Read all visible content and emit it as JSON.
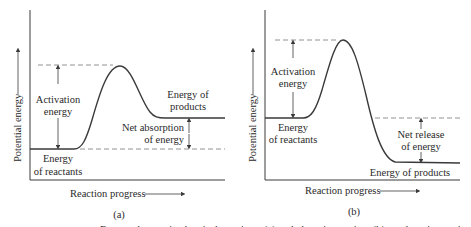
{
  "panels": [
    {
      "id": "a",
      "caption": "(a)",
      "ylabel": "Potential energy",
      "xlabel": "Reaction progress",
      "labels": {
        "activation_1": "Activation",
        "activation_2": "energy",
        "products_1": "Energy of",
        "products_2": "products",
        "net_1": "Net absorption",
        "net_2": "of energy",
        "reactants_1": "Energy",
        "reactants_2": "of reactants"
      }
    },
    {
      "id": "b",
      "caption": "(b)",
      "ylabel": "Potential energy",
      "xlabel": "Reaction progress",
      "labels": {
        "activation_1": "Activation",
        "activation_2": "energy",
        "reactants_1": "Energy",
        "reactants_2": "of reactants",
        "net_1": "Net release",
        "net_2": "of energy",
        "products": "Energy of products"
      }
    }
  ],
  "footer_caption_clipped": "Energy changes in chemical reactions: (a) endothermic reaction; (b) exothermic reaction"
}
